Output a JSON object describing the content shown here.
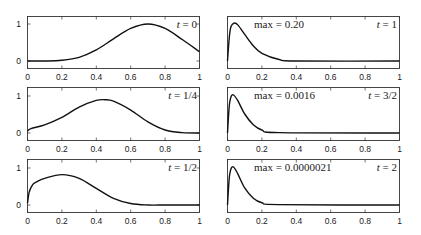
{
  "chart_data": [
    {
      "type": "line",
      "panel": "left-1",
      "label": "t = 0",
      "xlim": [
        0,
        1
      ],
      "ylim": [
        -0.2,
        1.2
      ],
      "xticks": [
        "0",
        "0.2",
        "0.4",
        "0.6",
        "0.8",
        "1"
      ],
      "yticks": [
        "0",
        "1"
      ],
      "x": [
        0,
        0.1,
        0.2,
        0.3,
        0.4,
        0.5,
        0.6,
        0.7,
        0.8,
        0.9,
        1.0
      ],
      "y": [
        0,
        0.0,
        0.02,
        0.1,
        0.3,
        0.6,
        0.88,
        1.0,
        0.88,
        0.58,
        0.25
      ]
    },
    {
      "type": "line",
      "panel": "left-2",
      "label": "t = 1/4",
      "xlim": [
        0,
        1
      ],
      "ylim": [
        -0.2,
        1.2
      ],
      "xticks": [
        "0",
        "0.2",
        "0.4",
        "0.6",
        "0.8",
        "1"
      ],
      "yticks": [
        "0",
        "1"
      ],
      "x": [
        0,
        0.02,
        0.1,
        0.2,
        0.3,
        0.4,
        0.45,
        0.5,
        0.6,
        0.7,
        0.8,
        0.9,
        1.0
      ],
      "y": [
        0.05,
        0.12,
        0.22,
        0.42,
        0.7,
        0.88,
        0.9,
        0.86,
        0.62,
        0.3,
        0.08,
        0.01,
        0.0
      ]
    },
    {
      "type": "line",
      "panel": "left-3",
      "label": "t = 1/2",
      "xlim": [
        0,
        1
      ],
      "ylim": [
        -0.2,
        1.2
      ],
      "xticks": [
        "0",
        "0.2",
        "0.4",
        "0.6",
        "0.8",
        "1"
      ],
      "yticks": [
        "0",
        "1"
      ],
      "x": [
        0,
        0.01,
        0.03,
        0.05,
        0.1,
        0.2,
        0.3,
        0.4,
        0.5,
        0.6,
        0.7,
        0.8,
        0.9,
        1.0
      ],
      "y": [
        0.05,
        0.35,
        0.55,
        0.62,
        0.72,
        0.82,
        0.72,
        0.45,
        0.18,
        0.04,
        0.0,
        0.0,
        0.0,
        0.0
      ]
    },
    {
      "type": "line",
      "panel": "right-1",
      "label": "t = 1",
      "annotation": "max = 0.20",
      "xlim": [
        0,
        1
      ],
      "xticks": [
        "0",
        "0.2",
        "0.4",
        "0.6",
        "0.8",
        "1"
      ],
      "x": [
        0,
        0.01,
        0.02,
        0.04,
        0.06,
        0.1,
        0.15,
        0.2,
        0.3,
        0.4,
        1.0
      ],
      "y": [
        0,
        0.6,
        0.9,
        1.0,
        0.95,
        0.7,
        0.4,
        0.2,
        0.04,
        0.0,
        0.0
      ]
    },
    {
      "type": "line",
      "panel": "right-2",
      "label": "t = 3/2",
      "annotation": "max = 0.0016",
      "xlim": [
        0,
        1
      ],
      "xticks": [
        "0",
        "0.2",
        "0.4",
        "0.6",
        "0.8",
        "1"
      ],
      "x": [
        0,
        0.01,
        0.02,
        0.035,
        0.06,
        0.1,
        0.15,
        0.2,
        0.3,
        1.0
      ],
      "y": [
        0,
        0.7,
        0.95,
        1.0,
        0.85,
        0.5,
        0.22,
        0.08,
        0.01,
        0.0
      ]
    },
    {
      "type": "line",
      "panel": "right-3",
      "label": "t = 2",
      "annotation": "max = 0.0000021",
      "xlim": [
        0,
        1
      ],
      "xticks": [
        "0",
        "0.2",
        "0.4",
        "0.6",
        "0.8",
        "1"
      ],
      "x": [
        0,
        0.01,
        0.02,
        0.035,
        0.06,
        0.1,
        0.15,
        0.2,
        0.3,
        1.0
      ],
      "y": [
        0,
        0.7,
        0.95,
        1.0,
        0.82,
        0.45,
        0.18,
        0.06,
        0.01,
        0.0
      ]
    }
  ],
  "panels": {
    "left": [
      {
        "t_label": "t = 0",
        "t_var": "t",
        "t_val": "= 0"
      },
      {
        "t_label": "t = 1/4",
        "t_var": "t",
        "t_val": "= 1/4"
      },
      {
        "t_label": "t = 1/2",
        "t_var": "t",
        "t_val": "= 1/2"
      }
    ],
    "right": [
      {
        "max_label": "max = 0.20",
        "t_var": "t",
        "t_val": "= 1"
      },
      {
        "max_label": "max = 0.0016",
        "t_var": "t",
        "t_val": "= 3/2"
      },
      {
        "max_label": "max = 0.0000021",
        "t_var": "t",
        "t_val": "= 2"
      }
    ]
  },
  "axes": {
    "xticks": [
      "0",
      "0.2",
      "0.4",
      "0.6",
      "0.8",
      "1"
    ],
    "yticks": [
      "0",
      "1"
    ]
  }
}
